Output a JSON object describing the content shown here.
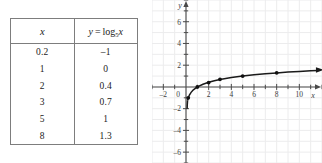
{
  "figure": {
    "kind": "table-and-graph",
    "background_color": "#ffffff"
  },
  "table": {
    "name": "logarithm-value-table",
    "border_color": "#7d7d7d",
    "columns": [
      {
        "key": "x",
        "label_plain": "x",
        "label_html_parts": {
          "variable": "x"
        }
      },
      {
        "key": "y",
        "label_plain": "y = log5 x",
        "label_html_parts": {
          "y": "y",
          "equals": "=",
          "log": "log",
          "base": "5",
          "arg": "x"
        }
      }
    ],
    "rows": [
      {
        "x": "0.2",
        "y": "–1"
      },
      {
        "x": "1",
        "y": "0"
      },
      {
        "x": "2",
        "y": "0.4"
      },
      {
        "x": "3",
        "y": "0.7"
      },
      {
        "x": "5",
        "y": "1"
      },
      {
        "x": "8",
        "y": "1.3"
      }
    ]
  },
  "chart_data": {
    "type": "line",
    "title": "",
    "xlabel": "x",
    "ylabel": "y",
    "xlim": [
      -3,
      12
    ],
    "ylim": [
      -7,
      8
    ],
    "grid": true,
    "grid_color": "#ececed",
    "grid_step": 1,
    "axis_color": "#4a4a4a",
    "curve_color": "#1a1a1a",
    "point_color": "#111111",
    "legend": null,
    "xticks": [
      -2,
      0,
      2,
      4,
      6,
      8,
      10
    ],
    "xtick_labels": [
      "–2",
      "0",
      "2",
      "4",
      "6",
      "8",
      "10"
    ],
    "yticks": [
      -6,
      -4,
      -2,
      2,
      4,
      6
    ],
    "ytick_labels": [
      "–6",
      "–4",
      "–2",
      "2",
      "4",
      "6"
    ],
    "function": "y = log_5(x)",
    "series": [
      {
        "name": "y = log5 x",
        "marker": "filled-circle",
        "x": [
          0.2,
          1,
          2,
          3,
          5,
          8
        ],
        "values": [
          -1,
          0,
          0.4,
          0.7,
          1,
          1.3
        ]
      }
    ],
    "curve_samples": {
      "x": [
        0.14,
        0.2,
        0.3,
        0.45,
        0.65,
        1,
        1.5,
        2,
        2.5,
        3,
        4,
        5,
        6,
        7,
        8,
        9,
        10,
        11,
        11.6
      ],
      "y": [
        -1.22,
        -1.0,
        -0.75,
        -0.5,
        -0.27,
        0,
        0.25,
        0.43,
        0.57,
        0.68,
        0.86,
        1.0,
        1.11,
        1.21,
        1.29,
        1.37,
        1.43,
        1.49,
        1.52
      ]
    },
    "annotations": [
      {
        "kind": "axis-arrow",
        "axis": "x",
        "direction": "right"
      },
      {
        "kind": "axis-arrow",
        "axis": "y",
        "direction": "up"
      },
      {
        "kind": "curve-arrow",
        "direction": "right",
        "note": "curve continues to the right"
      }
    ]
  }
}
